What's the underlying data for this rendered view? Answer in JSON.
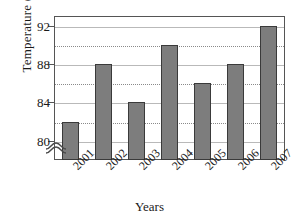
{
  "chart_data": {
    "type": "bar",
    "title": "",
    "xlabel": "Years",
    "ylabel_prefix": "Temperature (in F",
    "ylabel_degree": "°",
    "ylabel_suffix": ")",
    "ylabel_full": "Temperature (in F °)",
    "categories": [
      "2001",
      "2002",
      "2003",
      "2004",
      "2005",
      "2006",
      "2007"
    ],
    "values": [
      82,
      88,
      84,
      90,
      86,
      88,
      92
    ],
    "ylim": [
      78,
      93
    ],
    "ytick_labels": [
      "80",
      "84",
      "88",
      "92"
    ],
    "ytick_values": [
      80,
      84,
      88,
      92
    ],
    "minor_gridline_values": [
      82,
      86,
      90
    ],
    "grid": true,
    "legend": "none",
    "axis_break": true,
    "bar_color": "#7d7d7d",
    "bar_edge_color": "#3a3a3a",
    "grid_color": "#8a8a8a",
    "frame_color": "#555555",
    "background": "#ffffff"
  }
}
